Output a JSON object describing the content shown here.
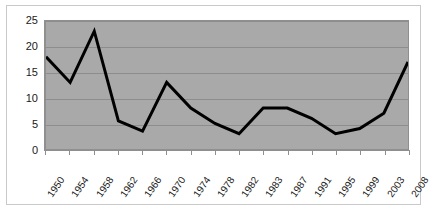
{
  "chart_data": {
    "type": "line",
    "title": "",
    "subtitle": "",
    "xlabel": "",
    "ylabel": "",
    "categories": [
      "1950",
      "1954",
      "1958",
      "1962",
      "1966",
      "1970",
      "1974",
      "1978",
      "1982",
      "1983",
      "1987",
      "1991",
      "1995",
      "1999",
      "2003",
      "2008"
    ],
    "values": [
      18,
      13,
      23,
      5.5,
      3.5,
      13,
      8,
      5,
      3,
      8,
      8,
      6,
      3,
      4,
      7,
      17
    ],
    "series": [
      {
        "name": "",
        "values": [
          18,
          13,
          23,
          5.5,
          3.5,
          13,
          8,
          5,
          3,
          8,
          8,
          6,
          3,
          4,
          7,
          17
        ]
      }
    ],
    "ylim": [
      0,
      25
    ],
    "y_ticks": [
      0,
      5,
      10,
      15,
      20,
      25
    ],
    "y_tick_labels": [
      "0",
      "5",
      "10",
      "15",
      "20",
      "25"
    ],
    "xlim_index": [
      0,
      15
    ],
    "grid": true,
    "grid_axis": "y",
    "legend": false,
    "legend_position": "none",
    "colors": {
      "line": "#000000",
      "plot_background": "#a9a9a9",
      "gridline": "#8d8d8d",
      "axis": "#8f8f8f",
      "frame": "#c9c9c9",
      "page_background": "#ffffff",
      "tick_text": "#1a1a1a"
    },
    "line_width": 3,
    "markers": false
  }
}
